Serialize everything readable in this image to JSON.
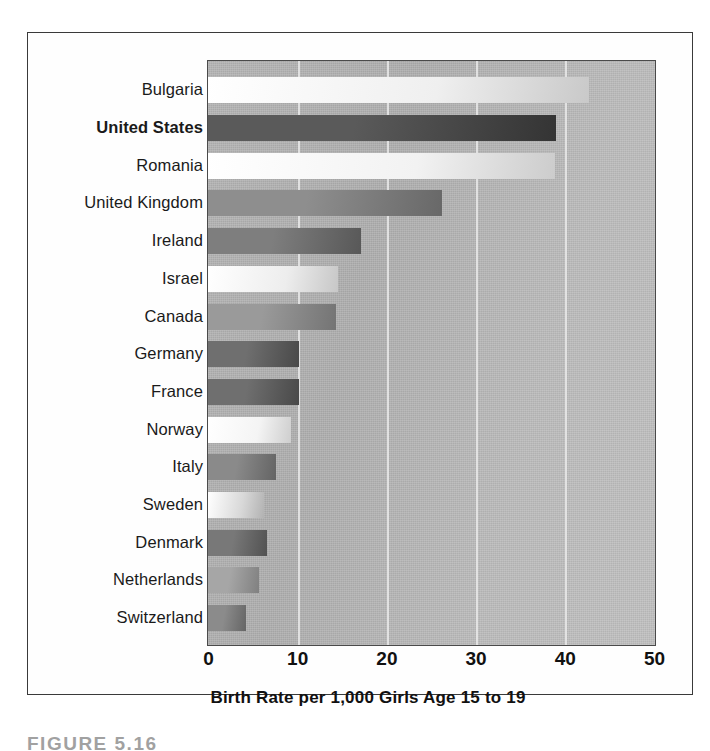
{
  "figure": {
    "caption": "FIGURE 5.16",
    "frame_color": "#3a3a3a",
    "plot_background": "#b8b8b8",
    "gridline_color": "#e9e9e9"
  },
  "axis": {
    "title": "Birth Rate per 1,000 Girls Age 15 to 19",
    "ticks": [
      "0",
      "10",
      "20",
      "30",
      "40",
      "50"
    ],
    "tick_values": [
      0,
      10,
      20,
      30,
      40,
      50
    ],
    "min": 0,
    "max": 50
  },
  "chart_data": {
    "type": "bar",
    "orientation": "horizontal",
    "title": "",
    "subtitle": "",
    "xlabel": "Birth Rate per 1,000 Girls Age 15 to 19",
    "ylabel": "",
    "xlim": [
      0,
      50
    ],
    "grid": true,
    "legend": "none",
    "highlight": "United States",
    "categories": [
      "Bulgaria",
      "United States",
      "Romania",
      "United Kingdom",
      "Ireland",
      "Israel",
      "Canada",
      "Germany",
      "France",
      "Norway",
      "Italy",
      "Sweden",
      "Denmark",
      "Netherlands",
      "Switzerland"
    ],
    "values": [
      42.6,
      38.9,
      38.7,
      26.1,
      17.0,
      14.4,
      14.2,
      10.0,
      10.0,
      9.1,
      7.4,
      6.1,
      6.4,
      5.6,
      4.1
    ],
    "bar_shades": [
      "#efefef",
      "#5a5a5a",
      "#f2f2f2",
      "#8e8e8e",
      "#7e7e7e",
      "#ededed",
      "#9a9a9a",
      "#6f6f6f",
      "#6f6f6f",
      "#f4f4f4",
      "#8a8a8a",
      "#d8d8d8",
      "#787878",
      "#a6a6a6",
      "#8b8b8b"
    ]
  }
}
